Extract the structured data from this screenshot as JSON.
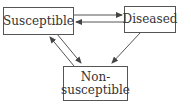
{
  "diagram": {
    "nodes": [
      {
        "id": "susceptible",
        "label": "Susceptible"
      },
      {
        "id": "diseased",
        "label": "Diseased"
      },
      {
        "id": "non_susceptible",
        "label_line1": "Non-",
        "label_line2": "susceptible"
      }
    ],
    "edges": [
      {
        "from": "susceptible",
        "to": "diseased"
      },
      {
        "from": "diseased",
        "to": "susceptible"
      },
      {
        "from": "susceptible",
        "to": "non_susceptible"
      },
      {
        "from": "non_susceptible",
        "to": "susceptible"
      },
      {
        "from": "diseased",
        "to": "non_susceptible"
      }
    ]
  }
}
